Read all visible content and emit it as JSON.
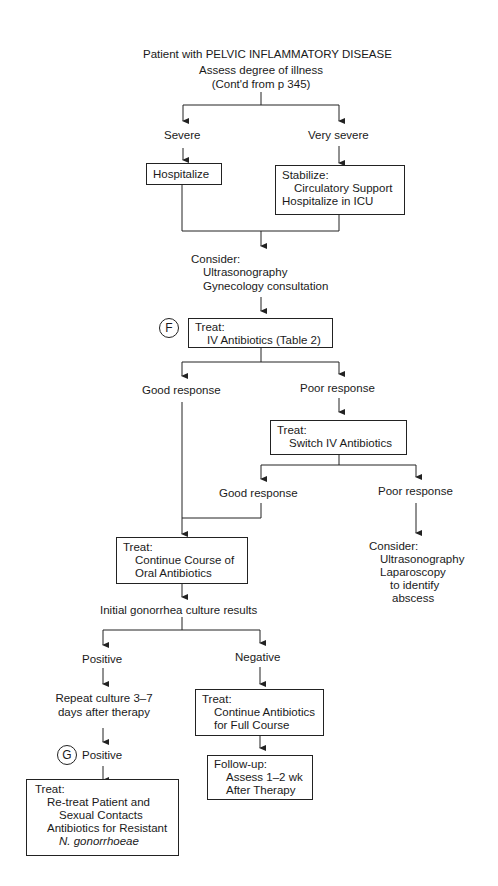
{
  "flowchart": {
    "title": "Patient with PELVIC INFLAMMATORY DISEASE",
    "assess": "Assess degree of illness",
    "contd": "(Cont'd from p 345)",
    "severe": "Severe",
    "very_severe": "Very severe",
    "hospitalize": "Hospitalize",
    "stabilize": {
      "head": "Stabilize:",
      "line1": "Circulatory Support",
      "line2": "Hospitalize in ICU"
    },
    "consider1": {
      "head": "Consider:",
      "line1": "Ultrasonography",
      "line2": "Gynecology consultation"
    },
    "marker_f": "F",
    "treat_iv": {
      "head": "Treat:",
      "line1": "IV Antibiotics (Table 2)"
    },
    "good_response_1": "Good response",
    "poor_response_1": "Poor response",
    "treat_switch": {
      "head": "Treat:",
      "line1": "Switch IV Antibiotics"
    },
    "good_response_2": "Good response",
    "poor_response_2": "Poor response",
    "consider2": {
      "head": "Consider:",
      "line1": "Ultrasonography",
      "line2": "Laparoscopy",
      "line3": "to identify",
      "line4": "abscess"
    },
    "treat_oral": {
      "head": "Treat:",
      "line1": "Continue Course of",
      "line2": "Oral Antibiotics"
    },
    "culture": "Initial gonorrhea culture results",
    "positive": "Positive",
    "negative": "Negative",
    "repeat": {
      "line1": "Repeat culture 3–7",
      "line2": "days after therapy"
    },
    "marker_g": "G",
    "positive2": "Positive",
    "treat_full": {
      "head": "Treat:",
      "line1": "Continue Antibiotics",
      "line2": "for Full Course"
    },
    "followup": {
      "head": "Follow-up:",
      "line1": "Assess 1–2 wk",
      "line2": "After Therapy"
    },
    "treat_resistant": {
      "head": "Treat:",
      "line1": "Re-treat Patient and",
      "line2": "Sexual Contacts",
      "line3": "Antibiotics for Resistant",
      "line4": "N. gonorrhoeae"
    }
  }
}
